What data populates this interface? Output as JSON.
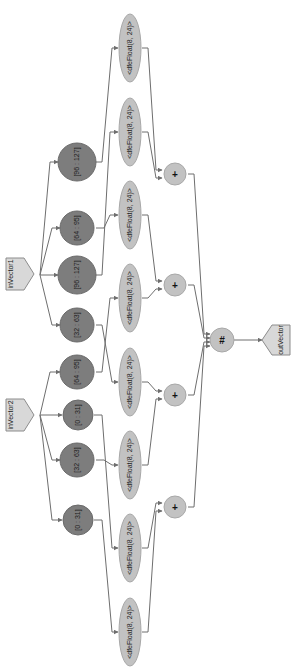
{
  "diagram": {
    "orientation": "rotated-90-clockwise",
    "colors": {
      "background": "#ffffff",
      "port_fill": "#d8d8d8",
      "slice_fill": "#7d7d7d",
      "cast_fill": "#c2c2c2",
      "op_fill": "#c2c2c2",
      "edge": "#6e6e6e"
    },
    "inputs": [
      {
        "id": "inVector1",
        "label": "inVector1"
      },
      {
        "id": "inVector2",
        "label": "inVector2"
      }
    ],
    "output": {
      "id": "outVector",
      "label": "outVector"
    },
    "slices": [
      {
        "id": "s1",
        "label": "[96 : 127]",
        "source": "inVector1"
      },
      {
        "id": "s2",
        "label": "[64 : 95]",
        "source": "inVector1"
      },
      {
        "id": "s3",
        "label": "[96 : 127]",
        "source": "inVector1"
      },
      {
        "id": "s4",
        "label": "[32 : 63]",
        "source": "inVector1"
      },
      {
        "id": "s5",
        "label": "[64 : 95]",
        "source": "inVector2"
      },
      {
        "id": "s6",
        "label": "[0 : 31]",
        "source": "inVector2"
      },
      {
        "id": "s7",
        "label": "[32 : 63]",
        "source": "inVector2"
      },
      {
        "id": "s8",
        "label": "[0 : 31]",
        "source": "inVector2"
      }
    ],
    "casts": [
      {
        "id": "c1",
        "label": "<dfeFloat(8, 24)>"
      },
      {
        "id": "c2",
        "label": "<dfeFloat(8, 24)>"
      },
      {
        "id": "c3",
        "label": "<dfeFloat(8, 24)>"
      },
      {
        "id": "c4",
        "label": "<dfeFloat(8, 24)>"
      },
      {
        "id": "c5",
        "label": "<dfeFloat(8, 24)>"
      },
      {
        "id": "c6",
        "label": "<dfeFloat(8, 24)>"
      },
      {
        "id": "c7",
        "label": "<dfeFloat(8, 24)>"
      },
      {
        "id": "c8",
        "label": "<dfeFloat(8, 24)>"
      }
    ],
    "adders": [
      {
        "id": "a1",
        "label": "+"
      },
      {
        "id": "a2",
        "label": "+"
      },
      {
        "id": "a3",
        "label": "+"
      },
      {
        "id": "a4",
        "label": "+"
      }
    ],
    "concat": {
      "id": "cat",
      "label": "#"
    }
  }
}
